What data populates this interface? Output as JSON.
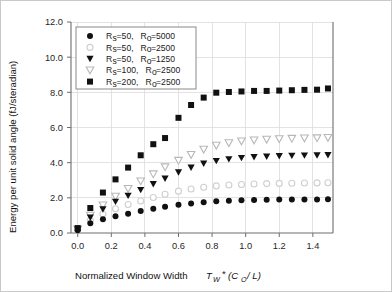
{
  "chart_data": {
    "type": "scatter",
    "title": "",
    "xlabel": "Normalized Window Width  T_W *(C_0/L)",
    "xlabel_parts": {
      "text": "Normalized Window Width",
      "sym_t": "T",
      "sym_t_sub": "W",
      "star": "*(",
      "sym_c": "C",
      "sym_c_sub": "O",
      "tail": "/L)"
    },
    "ylabel": "Energy per unit solid angle (fJ/steradian)",
    "xlim": [
      -0.04,
      1.52
    ],
    "ylim": [
      0.0,
      12.0
    ],
    "xticks": [
      0.0,
      0.2,
      0.4,
      0.6,
      0.8,
      1.0,
      1.2,
      1.4
    ],
    "xticklabels": [
      "0.0",
      "0.2",
      "0.4",
      "0.6",
      "0.8",
      "1.0",
      "1.2",
      "1.4"
    ],
    "yticks": [
      0.0,
      2.0,
      4.0,
      6.0,
      8.0,
      10.0,
      12.0
    ],
    "yticklabels": [
      "0.0",
      "2.0",
      "4.0",
      "6.0",
      "8.0",
      "10.0",
      "12.0"
    ],
    "grid": true,
    "legend_position": "upper-left",
    "series": [
      {
        "name": "Rs=50, Ro=5000",
        "label_parts": {
          "r1": "R",
          "s1": "s",
          "v1": "=50,",
          "r2": "R",
          "s2": "o",
          "v2": "=5000"
        },
        "marker": "filled-circle",
        "color": "#111111",
        "x": [
          0.0,
          0.075,
          0.15,
          0.225,
          0.3,
          0.375,
          0.45,
          0.52,
          0.6,
          0.675,
          0.75,
          0.825,
          0.9,
          0.975,
          1.05,
          1.125,
          1.2,
          1.275,
          1.35,
          1.425,
          1.49
        ],
        "y": [
          0.15,
          0.55,
          0.78,
          0.95,
          1.1,
          1.25,
          1.38,
          1.5,
          1.6,
          1.68,
          1.75,
          1.8,
          1.84,
          1.86,
          1.88,
          1.89,
          1.9,
          1.9,
          1.91,
          1.91,
          1.92
        ]
      },
      {
        "name": "Rs=50, Ro=2500",
        "label_parts": {
          "r1": "R",
          "s1": "s",
          "v1": "=50,",
          "r2": "R",
          "s2": "o",
          "v2": "=2500"
        },
        "marker": "open-circle",
        "color": "#cfcfcf",
        "x": [
          0.0,
          0.075,
          0.15,
          0.225,
          0.3,
          0.375,
          0.45,
          0.52,
          0.6,
          0.675,
          0.75,
          0.825,
          0.9,
          0.975,
          1.05,
          1.125,
          1.2,
          1.275,
          1.35,
          1.425,
          1.49
        ],
        "y": [
          0.18,
          0.72,
          1.08,
          1.38,
          1.62,
          1.82,
          2.02,
          2.2,
          2.38,
          2.5,
          2.6,
          2.68,
          2.73,
          2.76,
          2.79,
          2.81,
          2.82,
          2.83,
          2.84,
          2.85,
          2.86
        ]
      },
      {
        "name": "Rs=50, Ro=1250",
        "label_parts": {
          "r1": "R",
          "s1": "s",
          "v1": "=50,",
          "r2": "R",
          "s2": "o",
          "v2": "=1250"
        },
        "marker": "filled-triangle-down",
        "color": "#111111",
        "x": [
          0.0,
          0.075,
          0.15,
          0.225,
          0.3,
          0.375,
          0.45,
          0.52,
          0.6,
          0.675,
          0.75,
          0.825,
          0.9,
          0.975,
          1.05,
          1.125,
          1.2,
          1.275,
          1.35,
          1.425,
          1.49
        ],
        "y": [
          0.2,
          0.88,
          1.35,
          1.78,
          2.12,
          2.45,
          2.78,
          3.1,
          3.45,
          3.72,
          3.95,
          4.1,
          4.2,
          4.27,
          4.32,
          4.35,
          4.38,
          4.4,
          4.41,
          4.42,
          4.43
        ]
      },
      {
        "name": "Rs=100, Ro=2500",
        "label_parts": {
          "r1": "R",
          "s1": "s",
          "v1": "=100,",
          "r2": "R",
          "s2": "o",
          "v2": "=2500"
        },
        "marker": "open-triangle-down",
        "color": "#b8b8b8",
        "x": [
          0.0,
          0.075,
          0.15,
          0.225,
          0.3,
          0.375,
          0.45,
          0.52,
          0.6,
          0.675,
          0.75,
          0.825,
          0.9,
          0.975,
          1.05,
          1.125,
          1.2,
          1.275,
          1.35,
          1.425,
          1.49
        ],
        "y": [
          0.22,
          1.0,
          1.58,
          2.08,
          2.52,
          2.95,
          3.35,
          3.75,
          4.12,
          4.45,
          4.75,
          4.98,
          5.12,
          5.22,
          5.28,
          5.32,
          5.35,
          5.37,
          5.39,
          5.4,
          5.42
        ]
      },
      {
        "name": "Rs=200, Ro=2500",
        "label_parts": {
          "r1": "R",
          "s1": "s",
          "v1": "=200,",
          "r2": "R",
          "s2": "o",
          "v2": "=2500"
        },
        "marker": "filled-square",
        "color": "#111111",
        "x": [
          0.0,
          0.075,
          0.15,
          0.225,
          0.3,
          0.375,
          0.45,
          0.52,
          0.6,
          0.675,
          0.75,
          0.825,
          0.9,
          0.975,
          1.05,
          1.125,
          1.2,
          1.275,
          1.35,
          1.425,
          1.49
        ],
        "y": [
          0.28,
          1.42,
          2.3,
          3.05,
          3.72,
          4.42,
          5.05,
          5.4,
          6.55,
          7.28,
          7.7,
          7.98,
          8.02,
          8.05,
          8.08,
          8.08,
          8.1,
          8.12,
          8.14,
          8.15,
          8.22
        ]
      }
    ]
  }
}
